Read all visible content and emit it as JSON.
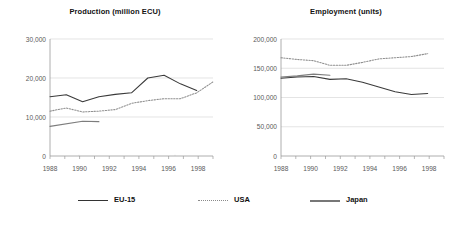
{
  "figure": {
    "background_color": "#ffffff",
    "width": 461,
    "height": 228
  },
  "legend": {
    "position": "bottom",
    "items": [
      {
        "label": "EU-15",
        "style": "solid",
        "color": "#3a3a3a",
        "icon": "line-swatch-icon"
      },
      {
        "label": "USA",
        "style": "dotted",
        "color": "#8f8f8f",
        "icon": "dotted-line-swatch-icon"
      },
      {
        "label": "Japan",
        "style": "solid",
        "color": "#7d7d7d",
        "icon": "thick-line-swatch-icon"
      }
    ]
  },
  "chart_data": [
    {
      "type": "line",
      "title": "Production (million ECU)",
      "xlabel": "",
      "ylabel": "",
      "xlim": [
        1987.5,
        1998.5
      ],
      "ylim": [
        0,
        30000
      ],
      "yticks": [
        0,
        10000,
        20000,
        30000
      ],
      "ytick_labels": [
        "0",
        "10,000",
        "20,000",
        "30,000"
      ],
      "xticks": [
        1988,
        1990,
        1992,
        1994,
        1996,
        1998
      ],
      "xtick_labels": [
        "1988",
        "1990",
        "1992",
        "1994",
        "1996",
        "1998"
      ],
      "x_minor_ticks": [
        1989,
        1991,
        1993,
        1995,
        1997
      ],
      "grid": "horizontal",
      "legend_position": "figure-bottom",
      "series": [
        {
          "name": "EU-15",
          "style": "solid",
          "color": "#3a3a3a",
          "x": [
            1988,
            1989,
            1990,
            1991,
            1992,
            1993,
            1994,
            1995,
            1996,
            1997
          ],
          "values": [
            15200,
            15700,
            13900,
            15200,
            15800,
            16200,
            20000,
            20700,
            18500,
            16800
          ]
        },
        {
          "name": "USA",
          "style": "dotted",
          "color": "#8f8f8f",
          "x": [
            1988,
            1989,
            1990,
            1991,
            1992,
            1993,
            1994,
            1995,
            1996,
            1997,
            1998
          ],
          "values": [
            11500,
            12300,
            11300,
            11500,
            11900,
            13500,
            14200,
            14700,
            14700,
            16200,
            19000
          ]
        },
        {
          "name": "Japan",
          "style": "solid",
          "color": "#7d7d7d",
          "x": [
            1988,
            1990,
            1991
          ],
          "values": [
            7600,
            8900,
            8800
          ]
        }
      ]
    },
    {
      "type": "line",
      "title": "Employment (units)",
      "xlabel": "",
      "ylabel": "",
      "xlim": [
        1987.5,
        1998.5
      ],
      "ylim": [
        0,
        200000
      ],
      "yticks": [
        0,
        50000,
        100000,
        150000,
        200000
      ],
      "ytick_labels": [
        "0",
        "50,000",
        "100,000",
        "150,000",
        "200,000"
      ],
      "xticks": [
        1988,
        1990,
        1992,
        1994,
        1996,
        1998
      ],
      "xtick_labels": [
        "1988",
        "1990",
        "1992",
        "1994",
        "1996",
        "1998"
      ],
      "x_minor_ticks": [
        1989,
        1991,
        1993,
        1995,
        1997
      ],
      "grid": "horizontal",
      "legend_position": "figure-bottom",
      "series": [
        {
          "name": "EU-15",
          "style": "solid",
          "color": "#3a3a3a",
          "x": [
            1988,
            1989,
            1990,
            1991,
            1992,
            1993,
            1994,
            1995,
            1996,
            1997
          ],
          "values": [
            133000,
            135000,
            136000,
            131000,
            132000,
            126000,
            118000,
            110000,
            105000,
            107000
          ]
        },
        {
          "name": "USA",
          "style": "dotted",
          "color": "#8f8f8f",
          "x": [
            1988,
            1989,
            1990,
            1991,
            1992,
            1993,
            1994,
            1995,
            1996,
            1997
          ],
          "values": [
            168000,
            165000,
            163000,
            155000,
            155000,
            160000,
            166000,
            168000,
            170000,
            175000
          ]
        },
        {
          "name": "Japan",
          "style": "solid",
          "color": "#7d7d7d",
          "x": [
            1988,
            1989,
            1990,
            1991
          ],
          "values": [
            135000,
            137000,
            140000,
            138000
          ]
        }
      ]
    }
  ]
}
